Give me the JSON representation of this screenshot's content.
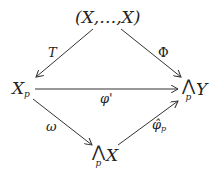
{
  "diagram": {
    "type": "commutative-diagram",
    "nodes": {
      "top": {
        "text": "(X,…,X)"
      },
      "left": {
        "base": "X",
        "sub": "p"
      },
      "right": {
        "wedge": "⋀",
        "sub": "p",
        "base": "Y"
      },
      "bottom": {
        "wedge": "⋀",
        "sub": "p",
        "base": "X"
      }
    },
    "arrows": [
      {
        "from": "top",
        "to": "left",
        "label": "T"
      },
      {
        "from": "top",
        "to": "right",
        "label": "Φ"
      },
      {
        "from": "left",
        "to": "right",
        "label": "φ'"
      },
      {
        "from": "left",
        "to": "bottom",
        "label": "ω"
      },
      {
        "from": "bottom",
        "to": "right",
        "label": "φ̂",
        "sub": "p"
      }
    ]
  }
}
